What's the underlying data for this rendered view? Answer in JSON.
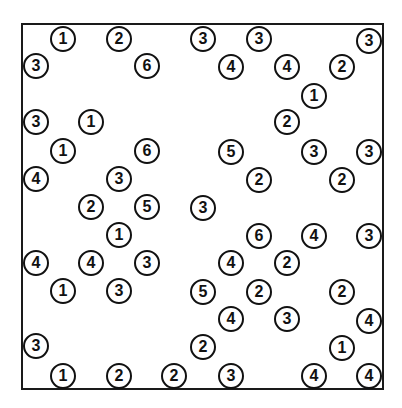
{
  "puzzle": {
    "type": "hashi",
    "border_color": "#1a1a1a",
    "islands": [
      {
        "x": 62,
        "y": 38,
        "value": "1"
      },
      {
        "x": 118,
        "y": 38,
        "value": "2"
      },
      {
        "x": 202,
        "y": 38,
        "value": "3"
      },
      {
        "x": 258,
        "y": 38,
        "value": "3"
      },
      {
        "x": 368,
        "y": 40,
        "value": "3"
      },
      {
        "x": 35,
        "y": 65,
        "value": "3"
      },
      {
        "x": 146,
        "y": 65,
        "value": "6"
      },
      {
        "x": 230,
        "y": 66,
        "value": "4"
      },
      {
        "x": 286,
        "y": 66,
        "value": "4"
      },
      {
        "x": 341,
        "y": 66,
        "value": "2"
      },
      {
        "x": 313,
        "y": 95,
        "value": "1"
      },
      {
        "x": 35,
        "y": 121,
        "value": "3"
      },
      {
        "x": 90,
        "y": 121,
        "value": "1"
      },
      {
        "x": 286,
        "y": 121,
        "value": "2"
      },
      {
        "x": 62,
        "y": 150,
        "value": "1"
      },
      {
        "x": 146,
        "y": 150,
        "value": "6"
      },
      {
        "x": 230,
        "y": 151,
        "value": "5"
      },
      {
        "x": 313,
        "y": 151,
        "value": "3"
      },
      {
        "x": 368,
        "y": 151,
        "value": "3"
      },
      {
        "x": 35,
        "y": 178,
        "value": "4"
      },
      {
        "x": 118,
        "y": 178,
        "value": "3"
      },
      {
        "x": 258,
        "y": 179,
        "value": "2"
      },
      {
        "x": 341,
        "y": 179,
        "value": "2"
      },
      {
        "x": 90,
        "y": 206,
        "value": "2"
      },
      {
        "x": 146,
        "y": 206,
        "value": "5"
      },
      {
        "x": 202,
        "y": 207,
        "value": "3"
      },
      {
        "x": 118,
        "y": 234,
        "value": "1"
      },
      {
        "x": 258,
        "y": 235,
        "value": "6"
      },
      {
        "x": 313,
        "y": 235,
        "value": "4"
      },
      {
        "x": 368,
        "y": 235,
        "value": "3"
      },
      {
        "x": 35,
        "y": 262,
        "value": "4"
      },
      {
        "x": 90,
        "y": 262,
        "value": "4"
      },
      {
        "x": 146,
        "y": 262,
        "value": "3"
      },
      {
        "x": 230,
        "y": 262,
        "value": "4"
      },
      {
        "x": 286,
        "y": 262,
        "value": "2"
      },
      {
        "x": 62,
        "y": 290,
        "value": "1"
      },
      {
        "x": 118,
        "y": 290,
        "value": "3"
      },
      {
        "x": 202,
        "y": 291,
        "value": "5"
      },
      {
        "x": 258,
        "y": 291,
        "value": "2"
      },
      {
        "x": 341,
        "y": 291,
        "value": "2"
      },
      {
        "x": 230,
        "y": 318,
        "value": "4"
      },
      {
        "x": 286,
        "y": 318,
        "value": "3"
      },
      {
        "x": 368,
        "y": 320,
        "value": "4"
      },
      {
        "x": 35,
        "y": 345,
        "value": "3"
      },
      {
        "x": 202,
        "y": 346,
        "value": "2"
      },
      {
        "x": 341,
        "y": 347,
        "value": "1"
      },
      {
        "x": 62,
        "y": 375,
        "value": "1"
      },
      {
        "x": 118,
        "y": 375,
        "value": "2"
      },
      {
        "x": 173,
        "y": 375,
        "value": "2"
      },
      {
        "x": 230,
        "y": 375,
        "value": "3"
      },
      {
        "x": 313,
        "y": 375,
        "value": "4"
      },
      {
        "x": 368,
        "y": 375,
        "value": "4"
      }
    ]
  }
}
